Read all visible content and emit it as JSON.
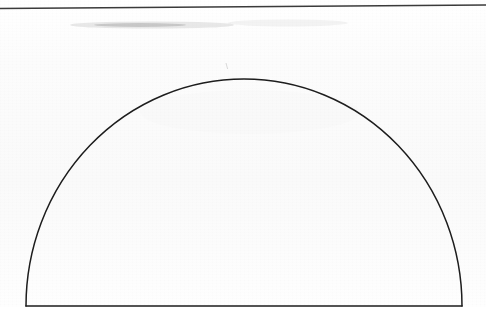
{
  "document": {
    "kind": "scanned-line-drawing",
    "canvas_width": 486,
    "canvas_height": 329,
    "background_color": "#fdfdfd",
    "ink_color": "#1d1d1d",
    "caption": ""
  },
  "figure": {
    "name": "semicircular-arch",
    "stroke_color": "#1d1d1d",
    "stroke_width": 1.5,
    "fill": "none",
    "geometry": {
      "center_x": 244,
      "baseline_y": 306,
      "radius_x": 218,
      "radius_y": 227,
      "apex_x": 244,
      "apex_y": 79,
      "left_foot_x": 26,
      "right_foot_x": 462
    },
    "base_line": {
      "name": "baseline",
      "x1": 26,
      "y1": 306,
      "x2": 462,
      "y2": 306
    },
    "arc_path": "M 26 306 A 218 227 0 0 1 462 306"
  },
  "rule": {
    "name": "top-horizontal-rule",
    "stroke_color": "#3a3a3a",
    "stroke_width": 1.4,
    "x1": 0,
    "y1": 8.5,
    "x2": 486,
    "y2": 5.0
  },
  "artifacts": [
    {
      "name": "scan-smudge-upper-left",
      "type": "smudge",
      "x": 70,
      "y": 21,
      "width": 165,
      "height": 8,
      "opacity": 0.22,
      "color": "#9a9a9a"
    },
    {
      "name": "scan-smudge-upper-right",
      "type": "smudge",
      "x": 228,
      "y": 19,
      "width": 120,
      "height": 7,
      "opacity": 0.1,
      "color": "#b4b4b4"
    },
    {
      "name": "pencil-tick-above-apex",
      "type": "tick",
      "x": 225,
      "y": 63,
      "width": 3,
      "height": 6,
      "opacity": 0.3,
      "color": "#8c8c8c"
    },
    {
      "name": "scan-shadow-bottom-edge",
      "type": "shadow",
      "x": 26,
      "y": 309,
      "width": 436,
      "height": 3,
      "opacity": 0.08,
      "color": "#a0a0a0"
    }
  ]
}
